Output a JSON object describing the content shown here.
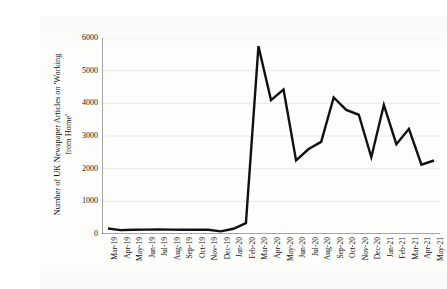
{
  "chart_data": {
    "type": "line",
    "title": "",
    "xlabel": "",
    "ylabel": "Number of UK Newspaper Articles on 'Working from Home'",
    "ylabel_line1": "Number of UK Newspaper Articles on 'Working",
    "ylabel_line2": "from Home'",
    "ylim": [
      0,
      6000
    ],
    "ytick_values": [
      0,
      1000,
      2000,
      3000,
      4000,
      5000,
      6000
    ],
    "ytick_labels": [
      "0",
      "1000",
      "2000",
      "3000",
      "4000",
      "5000",
      "6000"
    ],
    "grid": true,
    "grid_axis": "y",
    "legend": false,
    "legend_position": "none",
    "line_color": "#111111",
    "line_width": 2.4,
    "background_color": "#fdfdfc",
    "grid_color": "#e3e3e1",
    "axis_color": "#3a3a3a",
    "categories": [
      "Mar-19",
      "Apr-19",
      "May-19",
      "Jun-19",
      "Jul-19",
      "Aug-19",
      "Sep-19",
      "Oct-19",
      "Nov-19",
      "Dec-19",
      "Jan-20",
      "Feb-20",
      "Mar-20",
      "Apr-20",
      "May-20",
      "Jun-20",
      "Jul-20",
      "Aug-20",
      "Sep-20",
      "Oct-20",
      "Nov-20",
      "Dec-20",
      "Jan-21",
      "Feb-21",
      "Mar-21",
      "Apr-21",
      "May-21"
    ],
    "values": [
      170,
      120,
      130,
      135,
      140,
      135,
      130,
      135,
      130,
      80,
      160,
      330,
      5750,
      4100,
      4420,
      2250,
      2600,
      2820,
      4180,
      3800,
      3650,
      2350,
      3950,
      2750,
      3220,
      2120,
      2250
    ]
  },
  "ghost_artifacts": [
    {
      "text": "",
      "x": 0,
      "y": 0
    }
  ]
}
